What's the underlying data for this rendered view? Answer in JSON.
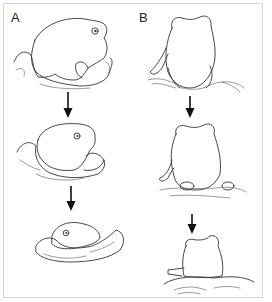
{
  "figure": {
    "panels": [
      {
        "label": "A",
        "view": "side view",
        "stages": [
          "frog sitting on soil",
          "frog partially burrowed",
          "frog nearly buried with only head visible"
        ]
      },
      {
        "label": "B",
        "view": "rear view",
        "stages": [
          "frog sitting on soil",
          "frog sinking into soil",
          "frog mostly buried"
        ]
      }
    ],
    "arrows": 4,
    "colors": {
      "line": "#333333",
      "border": "#d4d4d4",
      "background": "#ffffff"
    }
  }
}
